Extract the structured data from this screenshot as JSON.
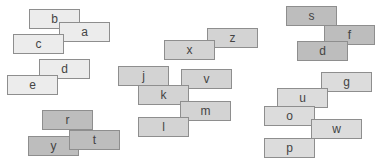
{
  "boxes": [
    {
      "label": "b",
      "x": 29,
      "y": 9,
      "tone": "light"
    },
    {
      "label": "a",
      "x": 59,
      "y": 22,
      "tone": "light"
    },
    {
      "label": "c",
      "x": 13,
      "y": 34,
      "tone": "light"
    },
    {
      "label": "d",
      "x": 39,
      "y": 59,
      "tone": "light"
    },
    {
      "label": "e",
      "x": 7,
      "y": 75,
      "tone": "light"
    },
    {
      "label": "r",
      "x": 42,
      "y": 110,
      "tone": "dark"
    },
    {
      "label": "y",
      "x": 28,
      "y": 136,
      "tone": "dark"
    },
    {
      "label": "t",
      "x": 69,
      "y": 130,
      "tone": "dark"
    },
    {
      "label": "z",
      "x": 207,
      "y": 28,
      "tone": "mid"
    },
    {
      "label": "x",
      "x": 164,
      "y": 40,
      "tone": "mid"
    },
    {
      "label": "j",
      "x": 118,
      "y": 66,
      "tone": "mid"
    },
    {
      "label": "v",
      "x": 181,
      "y": 69,
      "tone": "mid"
    },
    {
      "label": "k",
      "x": 138,
      "y": 85,
      "tone": "mid"
    },
    {
      "label": "m",
      "x": 180,
      "y": 101,
      "tone": "mid"
    },
    {
      "label": "l",
      "x": 138,
      "y": 117,
      "tone": "mid"
    },
    {
      "label": "s",
      "x": 286,
      "y": 6,
      "tone": "dark"
    },
    {
      "label": "f",
      "x": 324,
      "y": 25,
      "tone": "dark"
    },
    {
      "label": "d",
      "x": 297,
      "y": 41,
      "tone": "dark"
    },
    {
      "label": "g",
      "x": 321,
      "y": 72,
      "tone": "lmid"
    },
    {
      "label": "u",
      "x": 277,
      "y": 88,
      "tone": "lmid"
    },
    {
      "label": "o",
      "x": 264,
      "y": 106,
      "tone": "lmid"
    },
    {
      "label": "w",
      "x": 311,
      "y": 119,
      "tone": "lmid"
    },
    {
      "label": "p",
      "x": 264,
      "y": 138,
      "tone": "lmid"
    }
  ]
}
